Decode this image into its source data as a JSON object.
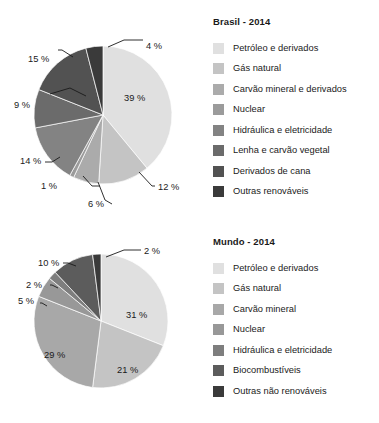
{
  "chart_data": [
    {
      "type": "pie",
      "title": "Brasil - 2014",
      "categories": [
        "Petróleo e derivados",
        "Gás natural",
        "Carvão mineral e derivados",
        "Nuclear",
        "Hidráulica e eletricidade",
        "Lenha e carvão vegetal",
        "Derivados de cana",
        "Outras renováveis"
      ],
      "values": [
        39,
        12,
        6,
        1,
        14,
        9,
        15,
        4
      ],
      "value_labels": [
        "39 %",
        "12 %",
        "6 %",
        "1 %",
        "14 %",
        "9 %",
        "15 %",
        "4 %"
      ],
      "colors": [
        "#e0e0e0",
        "#c4c4c4",
        "#ababab",
        "#9b9b9b",
        "#838383",
        "#6b6b6b",
        "#525252",
        "#3a3a3a"
      ],
      "start_angle_deg": 0,
      "direction": "clockwise",
      "legend_position": "right",
      "grid": false,
      "xlabel": "",
      "ylabel": ""
    },
    {
      "type": "pie",
      "title": "Mundo - 2014",
      "categories": [
        "Petróleo e derivados",
        "Gás natural",
        "Carvão mineral",
        "Nuclear",
        "Hidráulica e eletricidade",
        "Biocombustíveis",
        "Outras não renováveis"
      ],
      "values": [
        31,
        21,
        29,
        5,
        2,
        10,
        2
      ],
      "value_labels": [
        "31 %",
        "21 %",
        "29 %",
        "5 %",
        "2 %",
        "10 %",
        "2 %"
      ],
      "colors": [
        "#e0e0e0",
        "#c4c4c4",
        "#a8a8a8",
        "#989898",
        "#7e7e7e",
        "#5c5c5c",
        "#3a3a3a"
      ],
      "start_angle_deg": 0,
      "direction": "clockwise",
      "legend_position": "right",
      "grid": false,
      "xlabel": "",
      "ylabel": ""
    }
  ],
  "brasil": {
    "title": "Brasil - 2014",
    "legend": [
      {
        "label": "Petróleo e derivados",
        "color": "#e0e0e0"
      },
      {
        "label": "Gás natural",
        "color": "#c4c4c4"
      },
      {
        "label": "Carvão mineral e derivados",
        "color": "#ababab"
      },
      {
        "label": "Nuclear",
        "color": "#9b9b9b"
      },
      {
        "label": "Hidráulica e eletricidade",
        "color": "#838383"
      },
      {
        "label": "Lenha e carvão vegetal",
        "color": "#6b6b6b"
      },
      {
        "label": "Derivados de cana",
        "color": "#525252"
      },
      {
        "label": "Outras renováveis",
        "color": "#3a3a3a"
      }
    ],
    "callouts": {
      "p39": "39 %",
      "p12": "12 %",
      "p6": "6 %",
      "p1": "1 %",
      "p14": "14 %",
      "p9": "9 %",
      "p15": "15 %",
      "p4": "4 %"
    }
  },
  "mundo": {
    "title": "Mundo - 2014",
    "legend": [
      {
        "label": "Petróleo e derivados",
        "color": "#e0e0e0"
      },
      {
        "label": "Gás natural",
        "color": "#c4c4c4"
      },
      {
        "label": "Carvão mineral",
        "color": "#a8a8a8"
      },
      {
        "label": "Nuclear",
        "color": "#989898"
      },
      {
        "label": "Hidráulica e eletricidade",
        "color": "#7e7e7e"
      },
      {
        "label": "Biocombustíveis",
        "color": "#5c5c5c"
      },
      {
        "label": "Outras não renováveis",
        "color": "#3a3a3a"
      }
    ],
    "callouts": {
      "p31": "31 %",
      "p21": "21 %",
      "p29": "29 %",
      "p5": "5 %",
      "p2a": "2 %",
      "p10": "10 %",
      "p2b": "2 %"
    }
  },
  "footer": {
    "cut_text": ""
  }
}
